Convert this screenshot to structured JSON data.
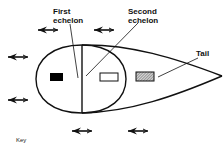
{
  "diagram": {
    "labels": {
      "first_echelon_line1": "First",
      "first_echelon_line2": "echelon",
      "second_echelon_line1": "Second",
      "second_echelon_line2": "echelon",
      "tail": "Tail",
      "key": "Key"
    },
    "colors": {
      "stroke": "#111111",
      "first_echelon_fill": "#000000",
      "second_echelon_fill": "#ffffff",
      "tail_fill": "#a8a8a8"
    },
    "elements": {
      "units": [
        {
          "name": "first-echelon-unit",
          "fill": "solid-black"
        },
        {
          "name": "second-echelon-unit",
          "fill": "white"
        },
        {
          "name": "tail-unit",
          "fill": "hatched"
        }
      ],
      "arrows": {
        "direction": "left",
        "count": 7
      }
    }
  }
}
